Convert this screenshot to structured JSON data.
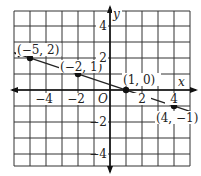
{
  "chart_data": {
    "type": "line",
    "title": "",
    "xlabel": "x",
    "ylabel": "y",
    "origin_label": "O",
    "xlim": [
      -6,
      5
    ],
    "ylim": [
      -5,
      5
    ],
    "grid": true,
    "x_ticks": [
      -4,
      -2,
      2,
      4
    ],
    "y_ticks": [
      4,
      2,
      -2,
      -4
    ],
    "x_tick_labels": [
      "−4",
      "−2",
      "2",
      "4"
    ],
    "y_tick_labels": [
      "4",
      "2",
      "−2",
      "−4"
    ],
    "series": [
      {
        "name": "line",
        "equation": "y = -x/3 + 1/3",
        "points": [
          {
            "x": -5,
            "y": 2,
            "label": "(−5, 2)"
          },
          {
            "x": -2,
            "y": 1,
            "label": "(−2, 1)"
          },
          {
            "x": 1,
            "y": 0,
            "label": "(1, 0)"
          },
          {
            "x": 4,
            "y": -1,
            "label": "(4, −1)"
          }
        ]
      }
    ],
    "line_color": "#222222",
    "grid_color": "#333333"
  }
}
